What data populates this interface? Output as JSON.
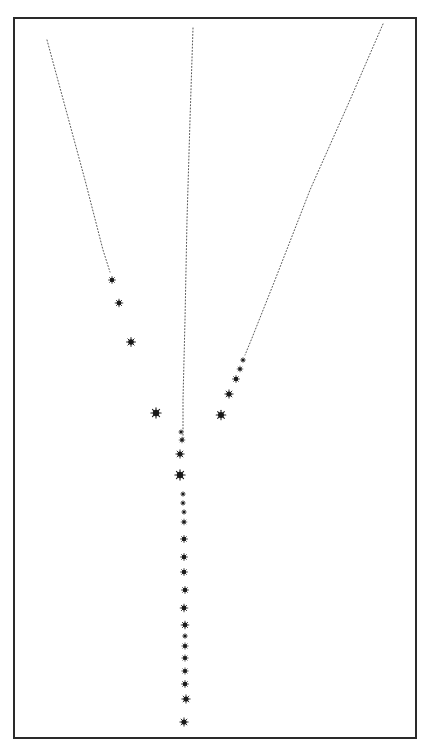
{
  "figure": {
    "type": "particle-track-diagram",
    "frame": {
      "x": 13,
      "y": 17,
      "width": 402,
      "height": 720,
      "border_color": "#2a2a2a"
    },
    "colors": {
      "background": "#ffffff",
      "track": "#555555",
      "blob": "#1a1a1a"
    },
    "tracks": [
      {
        "name": "left-track",
        "points": [
          [
            47,
            40
          ],
          [
            66,
            110
          ],
          [
            85,
            180
          ],
          [
            103,
            250
          ],
          [
            110,
            272
          ]
        ]
      },
      {
        "name": "center-track",
        "points": [
          [
            193,
            28
          ],
          [
            190,
            120
          ],
          [
            187,
            220
          ],
          [
            185,
            320
          ],
          [
            183,
            400
          ],
          [
            183,
            440
          ]
        ]
      },
      {
        "name": "right-track",
        "points": [
          [
            383,
            24
          ],
          [
            350,
            100
          ],
          [
            310,
            190
          ],
          [
            275,
            280
          ],
          [
            252,
            338
          ],
          [
            245,
            355
          ]
        ]
      }
    ],
    "blobs": {
      "left_branch": [
        {
          "x": 112,
          "y": 280,
          "r": 2.2
        },
        {
          "x": 119,
          "y": 303,
          "r": 2.4
        },
        {
          "x": 131,
          "y": 342,
          "r": 2.8
        },
        {
          "x": 156,
          "y": 413,
          "r": 3.2
        }
      ],
      "right_branch": [
        {
          "x": 243,
          "y": 360,
          "r": 1.6
        },
        {
          "x": 240,
          "y": 369,
          "r": 1.8
        },
        {
          "x": 236,
          "y": 379,
          "r": 2.2
        },
        {
          "x": 229,
          "y": 394,
          "r": 2.6
        },
        {
          "x": 221,
          "y": 415,
          "r": 3.0
        }
      ],
      "stem": [
        {
          "x": 181,
          "y": 432,
          "r": 1.4
        },
        {
          "x": 182,
          "y": 440,
          "r": 1.8
        },
        {
          "x": 180,
          "y": 454,
          "r": 2.6
        },
        {
          "x": 180,
          "y": 475,
          "r": 3.2
        },
        {
          "x": 183,
          "y": 494,
          "r": 1.5
        },
        {
          "x": 183,
          "y": 503,
          "r": 1.5
        },
        {
          "x": 184,
          "y": 512,
          "r": 1.5
        },
        {
          "x": 184,
          "y": 522,
          "r": 1.8
        },
        {
          "x": 184,
          "y": 539,
          "r": 2.2
        },
        {
          "x": 184,
          "y": 557,
          "r": 2.2
        },
        {
          "x": 184,
          "y": 572,
          "r": 2.2
        },
        {
          "x": 185,
          "y": 590,
          "r": 2.2
        },
        {
          "x": 184,
          "y": 608,
          "r": 2.4
        },
        {
          "x": 185,
          "y": 625,
          "r": 2.4
        },
        {
          "x": 185,
          "y": 636,
          "r": 1.6
        },
        {
          "x": 185,
          "y": 646,
          "r": 2.0
        },
        {
          "x": 185,
          "y": 658,
          "r": 2.0
        },
        {
          "x": 185,
          "y": 671,
          "r": 2.0
        },
        {
          "x": 185,
          "y": 684,
          "r": 2.2
        },
        {
          "x": 186,
          "y": 699,
          "r": 2.6
        },
        {
          "x": 184,
          "y": 722,
          "r": 2.6
        }
      ]
    }
  }
}
